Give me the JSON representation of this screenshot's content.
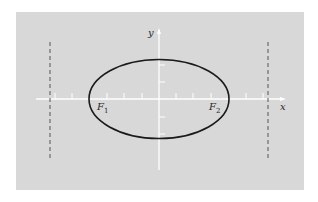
{
  "figure": {
    "background_color": "#d8d8d8",
    "axis_color": "#ffffff",
    "curve_color": "#1a1a1a",
    "directrix_color": "#555555"
  },
  "labels": {
    "x_axis": "x",
    "y_axis": "y",
    "focus1_letter": "F",
    "focus1_sub": "1",
    "focus2_letter": "F",
    "focus2_sub": "2"
  },
  "geometry": {
    "origin": [
      159,
      99
    ],
    "ellipse": {
      "cx": 159,
      "cy": 99,
      "rx": 70,
      "ry": 40
    },
    "foci_x": [
      100,
      218
    ],
    "directrices_x": [
      50,
      268
    ]
  }
}
